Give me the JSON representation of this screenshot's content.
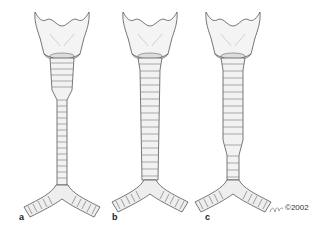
{
  "figure": {
    "panels": [
      {
        "label": "a",
        "description": "trachea narrowing in lower segment"
      },
      {
        "label": "b",
        "description": "trachea uniformly wide"
      },
      {
        "label": "c",
        "description": "trachea wide upper, tapering lower"
      }
    ],
    "signature": "©2002"
  }
}
